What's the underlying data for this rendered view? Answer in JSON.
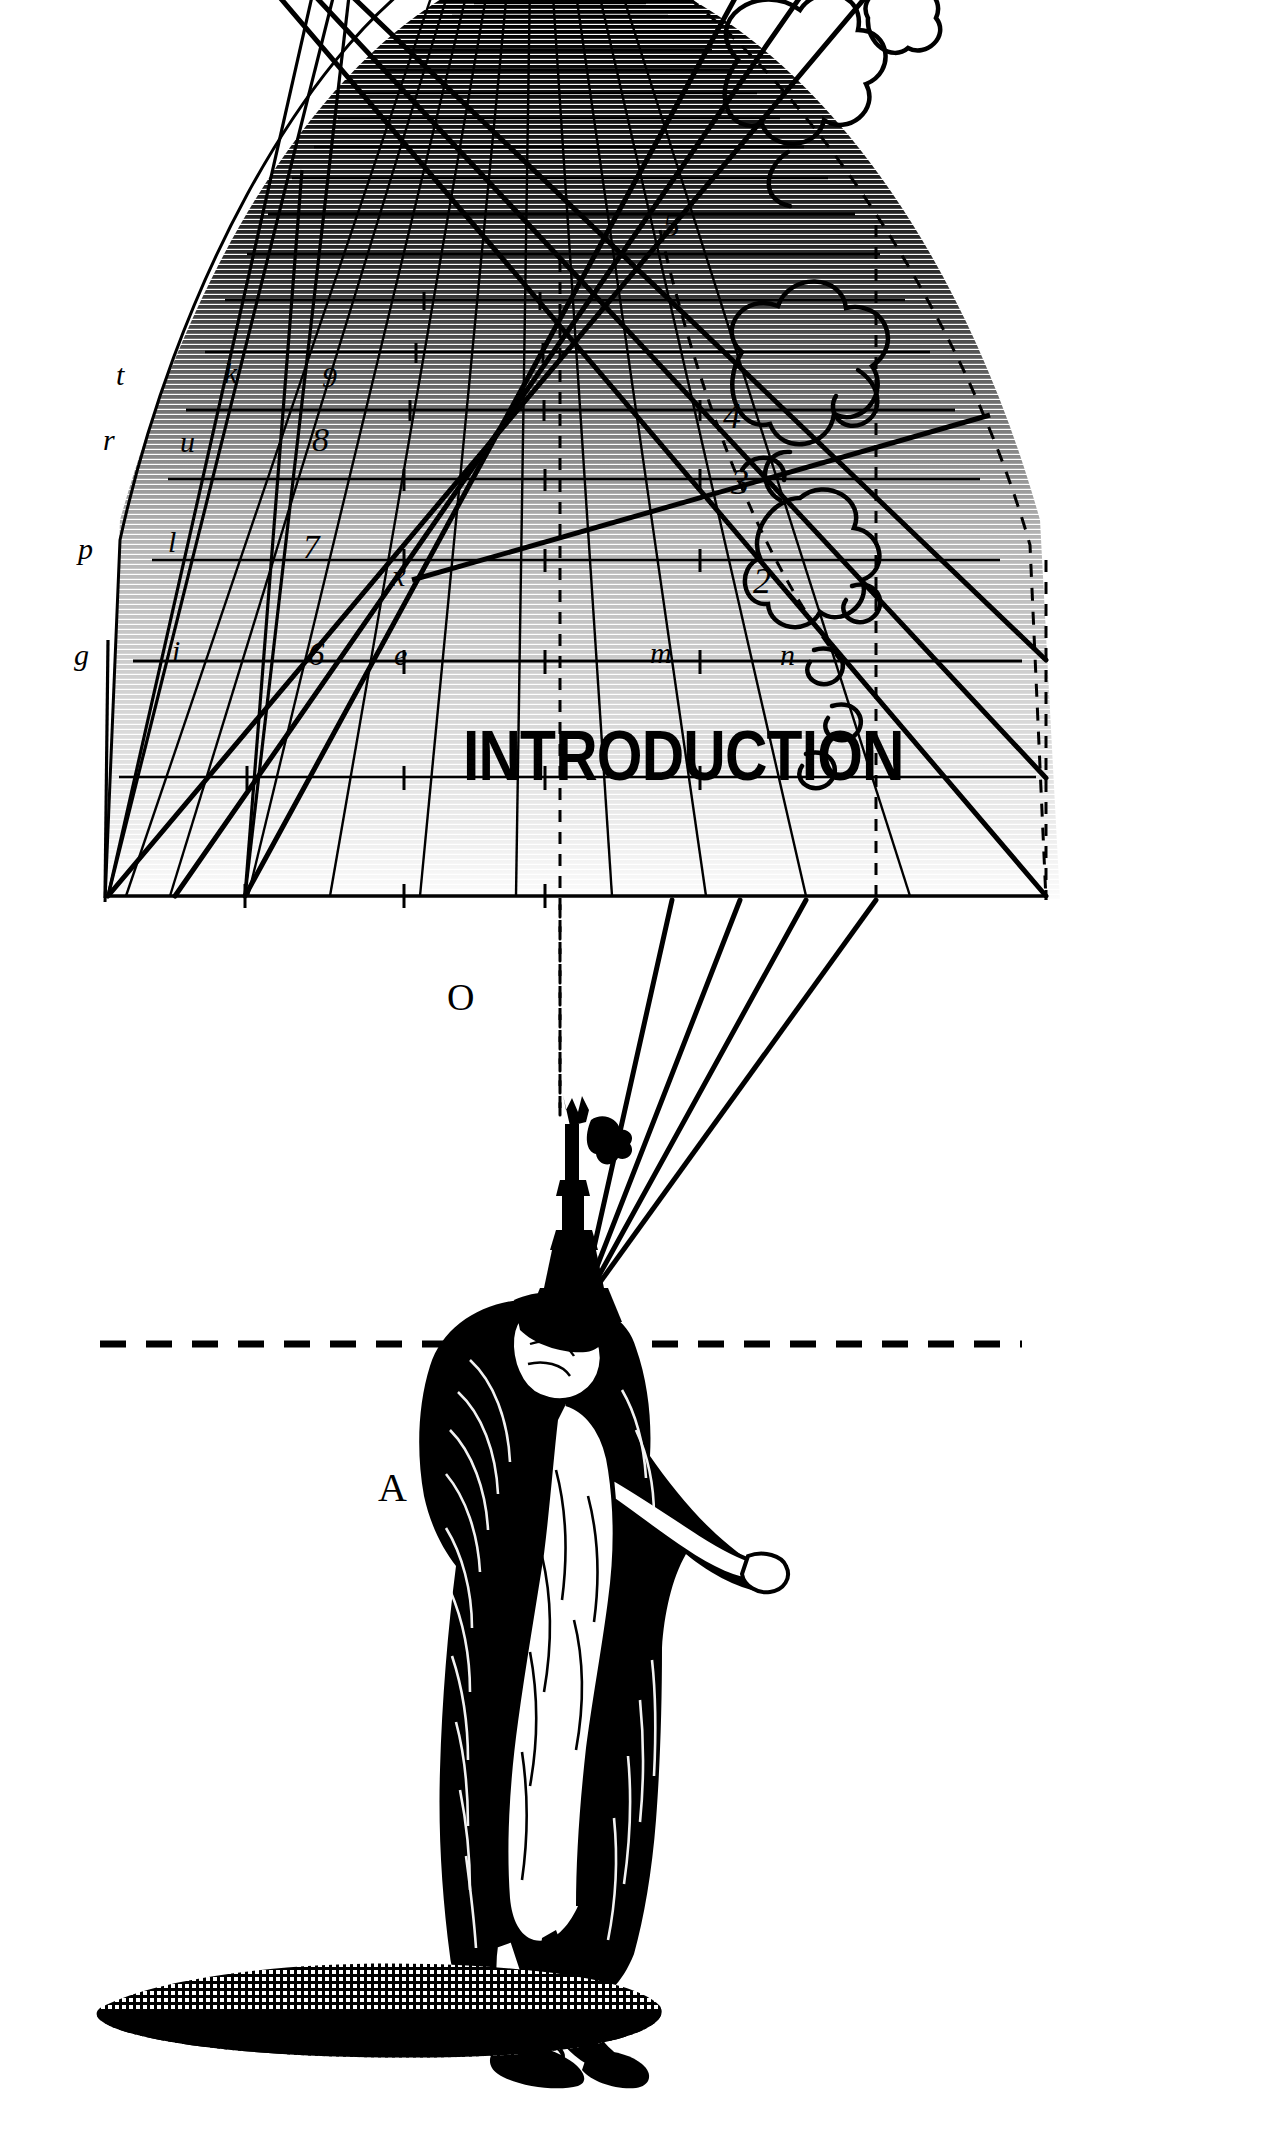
{
  "page": {
    "title_text": "INTRODUCTION",
    "background": "#ffffff",
    "ink": "#000000",
    "width": 1276,
    "height": 2138
  },
  "figure": {
    "caption": "INTRODUCTION"
  },
  "diagram": {
    "name": "perspective-grid-vault",
    "eye_point_label": "O",
    "ground_point_label": "A",
    "horizon_line": "dashed",
    "left_column_labels": [
      "t",
      "r",
      "p",
      "g"
    ],
    "second_column_labels": [
      "k",
      "u",
      "l",
      "i"
    ],
    "center_number_labels": [
      "9",
      "8",
      "7",
      "6"
    ],
    "center_point_labels": [
      "x",
      "e"
    ],
    "right_number_labels": [
      "5",
      "4",
      "3",
      "2"
    ],
    "right_point_labels": [
      "m",
      "n"
    ]
  },
  "labels": [
    {
      "id": "t",
      "text": "t",
      "x": 116,
      "y": 360,
      "kind": "letter"
    },
    {
      "id": "k",
      "text": "k",
      "x": 224,
      "y": 358,
      "kind": "letter"
    },
    {
      "id": "9",
      "text": "9",
      "x": 322,
      "y": 362,
      "kind": "number"
    },
    {
      "id": "r",
      "text": "r",
      "x": 103,
      "y": 425,
      "kind": "letter"
    },
    {
      "id": "u",
      "text": "u",
      "x": 180,
      "y": 427,
      "kind": "letter"
    },
    {
      "id": "8",
      "text": "8",
      "x": 312,
      "y": 423,
      "kind": "number"
    },
    {
      "id": "p",
      "text": "p",
      "x": 78,
      "y": 534,
      "kind": "letter"
    },
    {
      "id": "l",
      "text": "l",
      "x": 168,
      "y": 527,
      "kind": "letter"
    },
    {
      "id": "7",
      "text": "7",
      "x": 303,
      "y": 531,
      "kind": "number"
    },
    {
      "id": "x",
      "text": "x",
      "x": 392,
      "y": 561,
      "kind": "letter"
    },
    {
      "id": "g",
      "text": "g",
      "x": 74,
      "y": 640,
      "kind": "letter"
    },
    {
      "id": "i",
      "text": "i",
      "x": 172,
      "y": 636,
      "kind": "letter"
    },
    {
      "id": "6",
      "text": "6",
      "x": 308,
      "y": 638,
      "kind": "number"
    },
    {
      "id": "e",
      "text": "e",
      "x": 394,
      "y": 640,
      "kind": "letter"
    },
    {
      "id": "m",
      "text": "m",
      "x": 650,
      "y": 638,
      "kind": "letter"
    },
    {
      "id": "n",
      "text": "n",
      "x": 780,
      "y": 640,
      "kind": "letter"
    },
    {
      "id": "5",
      "text": "5",
      "x": 663,
      "y": 208,
      "kind": "number"
    },
    {
      "id": "4",
      "text": "4",
      "x": 723,
      "y": 398,
      "kind": "number"
    },
    {
      "id": "3",
      "text": "3",
      "x": 731,
      "y": 464,
      "kind": "number"
    },
    {
      "id": "2",
      "text": "2",
      "x": 753,
      "y": 563,
      "kind": "number"
    },
    {
      "id": "O",
      "text": "O",
      "x": 447,
      "y": 978,
      "kind": "cap"
    },
    {
      "id": "A",
      "text": "A",
      "x": 378,
      "y": 1468,
      "kind": "cap"
    }
  ],
  "title": {
    "text": "INTRODUCTION",
    "x": 463,
    "y": 721,
    "color": "#000000"
  }
}
